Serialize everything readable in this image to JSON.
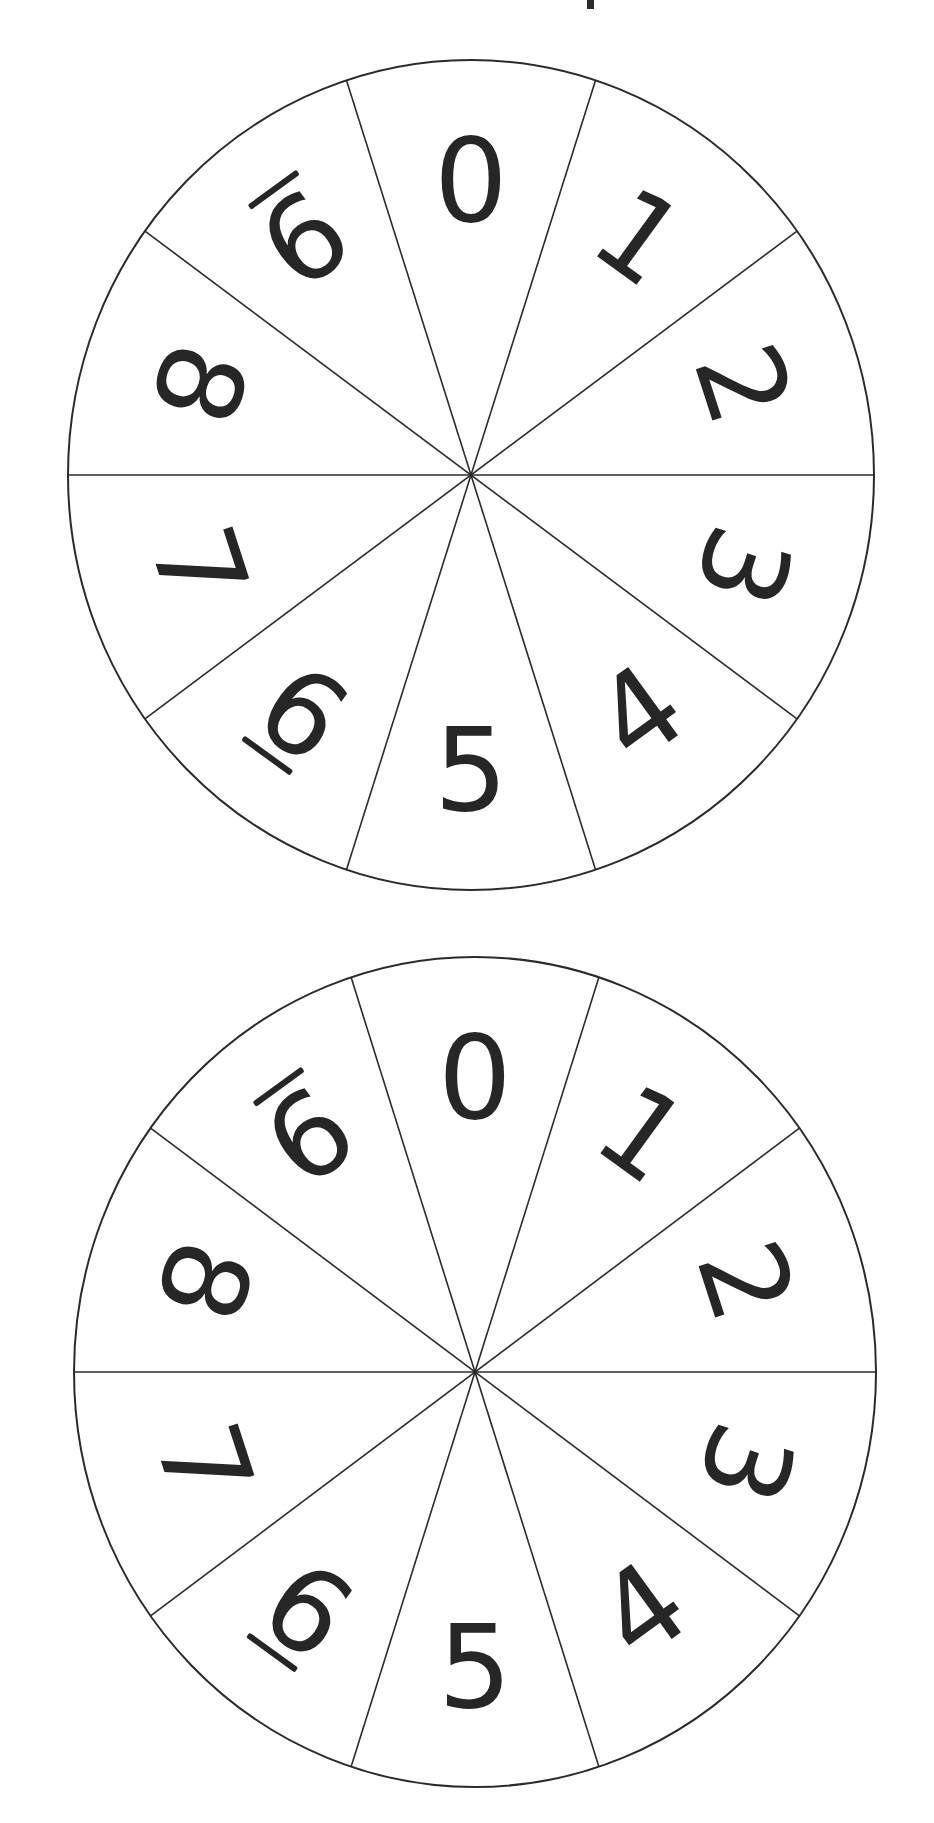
{
  "document": {
    "title": "Number spinners 0-9",
    "description": "Two identical ten-section spinner wheels, each divided into 10 equal sectors labelled 0 through 9; digits 6 and 9 are underlined to distinguish them."
  },
  "colors": {
    "background": "#ffffff",
    "line": "#2b2b2b",
    "digit": "#262626"
  },
  "spinners": [
    {
      "id": "spinner-top",
      "center": [
        471,
        475
      ],
      "rx": 403,
      "ry": 415,
      "sectors": [
        {
          "label": "0",
          "angle": 0,
          "rotate": 0,
          "underline": false
        },
        {
          "label": "1",
          "angle": 36,
          "rotate": 36,
          "underline": false
        },
        {
          "label": "2",
          "angle": 72,
          "rotate": 72,
          "underline": false
        },
        {
          "label": "3",
          "angle": 108,
          "rotate": 108,
          "underline": false
        },
        {
          "label": "4",
          "angle": 144,
          "rotate": -36,
          "underline": false
        },
        {
          "label": "5",
          "angle": 180,
          "rotate": 0,
          "underline": false
        },
        {
          "label": "6",
          "angle": 216,
          "rotate": 36,
          "underline": true
        },
        {
          "label": "7",
          "angle": 252,
          "rotate": 72,
          "underline": false
        },
        {
          "label": "8",
          "angle": 288,
          "rotate": 108,
          "underline": false
        },
        {
          "label": "9",
          "angle": 324,
          "rotate": 144,
          "underline": true
        }
      ]
    },
    {
      "id": "spinner-bottom",
      "center": [
        475,
        1372
      ],
      "rx": 401,
      "ry": 415,
      "sectors": [
        {
          "label": "0",
          "angle": 0,
          "rotate": 0,
          "underline": false
        },
        {
          "label": "1",
          "angle": 36,
          "rotate": 36,
          "underline": false
        },
        {
          "label": "2",
          "angle": 72,
          "rotate": 72,
          "underline": false
        },
        {
          "label": "3",
          "angle": 108,
          "rotate": 108,
          "underline": false
        },
        {
          "label": "4",
          "angle": 144,
          "rotate": -36,
          "underline": false
        },
        {
          "label": "5",
          "angle": 180,
          "rotate": 0,
          "underline": false
        },
        {
          "label": "6",
          "angle": 216,
          "rotate": 36,
          "underline": true
        },
        {
          "label": "7",
          "angle": 252,
          "rotate": 72,
          "underline": false
        },
        {
          "label": "8",
          "angle": 288,
          "rotate": 108,
          "underline": false
        },
        {
          "label": "9",
          "angle": 324,
          "rotate": 144,
          "underline": true
        }
      ]
    }
  ]
}
